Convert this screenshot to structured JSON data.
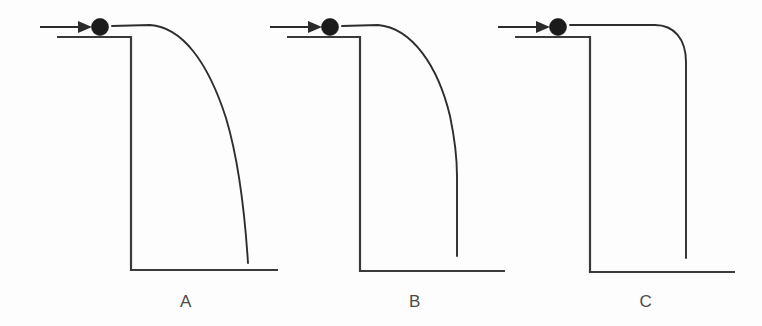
{
  "figure": {
    "background_color": "#fdfdfd",
    "line_color": "#3a3a3a",
    "ball_color": "#1b1b1b",
    "width": 762,
    "height": 326
  },
  "panels": [
    {
      "label": "A",
      "label_x": 186,
      "label_y": 307,
      "ball": {
        "cx": 100,
        "cy": 27,
        "r": 8.5
      },
      "arrow": {
        "x1": 40,
        "y1": 27,
        "x2": 88,
        "y2": 27,
        "head_points": "78,21 92,27 78,33"
      },
      "ledge_path": "M 57 37 L 131 37 L 131 270 L 278 270",
      "trajectory_path": "M 112 26 L 150 25 C 182 27 208 62 226 118 C 238 158 245 216 248 263",
      "trajectory_shape": "parabolic-arc-steepening-to-ground"
    },
    {
      "label": "B",
      "label_x": 415,
      "label_y": 307,
      "ball": {
        "cx": 330,
        "cy": 27,
        "r": 8.5
      },
      "arrow": {
        "x1": 270,
        "y1": 27,
        "x2": 318,
        "y2": 27,
        "head_points": "308,21 322,27 308,33"
      },
      "ledge_path": "M 287 37 L 360 37 L 360 271 L 505 271",
      "trajectory_path": "M 342 26 L 378 25 C 412 28 438 66 450 116 C 455 140 457 160 457 176 L 457 256",
      "trajectory_shape": "arc-becoming-vertical-partway-down"
    },
    {
      "label": "C",
      "label_x": 646,
      "label_y": 307,
      "ball": {
        "cx": 558,
        "cy": 27,
        "r": 8.5
      },
      "arrow": {
        "x1": 498,
        "y1": 27,
        "x2": 546,
        "y2": 27,
        "head_points": "536,21 550,27 536,33"
      },
      "ledge_path": "M 515 37 L 590 37 L 590 272 L 735 272",
      "trajectory_path": "M 570 25 L 655 25 C 674 25 686 39 686 62 L 686 258",
      "trajectory_shape": "horizontal-then-sharp-quarter-turn-to-vertical"
    }
  ],
  "icons": {
    "arrow": "right-arrow-icon",
    "ball": "ball-icon"
  }
}
